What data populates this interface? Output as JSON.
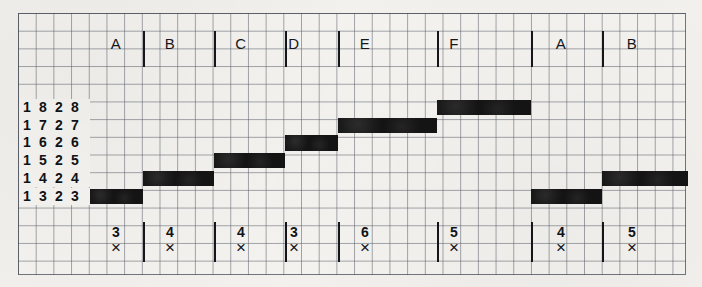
{
  "chart_data": {
    "type": "bar",
    "title": "",
    "xlabel": "",
    "ylabel": "",
    "grid": true,
    "legend_position": "none",
    "categories": [
      "A",
      "B",
      "C",
      "D",
      "E",
      "F",
      "A",
      "B"
    ],
    "row_labels": [
      "1828",
      "1727",
      "1626",
      "1525",
      "1424",
      "1323"
    ],
    "row_level_values": [
      8,
      7,
      6,
      5,
      4,
      3
    ],
    "bottom_values": [
      3,
      4,
      4,
      3,
      6,
      5,
      4,
      5
    ],
    "bottom_marker": "×",
    "series": [
      {
        "name": "step-bars",
        "values": [
          3,
          4,
          5,
          6,
          7,
          8,
          3,
          4
        ],
        "note": "each bar occupies the row matching its value; bars step upward across A-F then restart at A"
      }
    ],
    "bars": [
      {
        "category": "A",
        "row_label": "1323",
        "row_index": 5,
        "value": 3,
        "x": 90,
        "w": 53
      },
      {
        "category": "B",
        "row_label": "1424",
        "row_index": 4,
        "value": 4,
        "x": 143,
        "w": 71
      },
      {
        "category": "C",
        "row_label": "1525",
        "row_index": 3,
        "value": 5,
        "x": 214,
        "w": 71
      },
      {
        "category": "D",
        "row_label": "1626",
        "row_index": 2,
        "value": 6,
        "x": 285,
        "w": 53
      },
      {
        "category": "E",
        "row_label": "1727",
        "row_index": 1,
        "value": 7,
        "x": 338,
        "w": 99
      },
      {
        "category": "F",
        "row_label": "1828",
        "row_index": 0,
        "value": 8,
        "x": 437,
        "w": 94
      },
      {
        "category": "A",
        "row_label": "1323",
        "row_index": 5,
        "value": 3,
        "x": 531,
        "w": 71
      },
      {
        "category": "B",
        "row_label": "1424",
        "row_index": 4,
        "value": 4,
        "x": 602,
        "w": 86
      }
    ],
    "ylim": [
      3,
      8
    ],
    "axis_note": "rows labelled 1828 (top) down to 1323 (bottom)"
  },
  "header": {
    "letters": [
      "A",
      "B",
      "C",
      "D",
      "E",
      "F",
      "A",
      "B"
    ]
  },
  "footer": {
    "cells": [
      {
        "number": "3",
        "mark": "×"
      },
      {
        "number": "4",
        "mark": "×"
      },
      {
        "number": "4",
        "mark": "×"
      },
      {
        "number": "3",
        "mark": "×"
      },
      {
        "number": "6",
        "mark": "×"
      },
      {
        "number": "5",
        "mark": "×"
      },
      {
        "number": "4",
        "mark": "×"
      },
      {
        "number": "5",
        "mark": "×"
      }
    ]
  },
  "row_labels": [
    {
      "digits": [
        "1",
        "8",
        "2",
        "8"
      ]
    },
    {
      "digits": [
        "1",
        "7",
        "2",
        "7"
      ]
    },
    {
      "digits": [
        "1",
        "6",
        "2",
        "6"
      ]
    },
    {
      "digits": [
        "1",
        "5",
        "2",
        "5"
      ]
    },
    {
      "digits": [
        "1",
        "4",
        "2",
        "4"
      ]
    },
    {
      "digits": [
        "1",
        "3",
        "2",
        "3"
      ]
    }
  ],
  "colors": {
    "bar": "#141414",
    "grid": "#5a5f69",
    "paper": "#f4f3f0",
    "ink": "#101216"
  }
}
